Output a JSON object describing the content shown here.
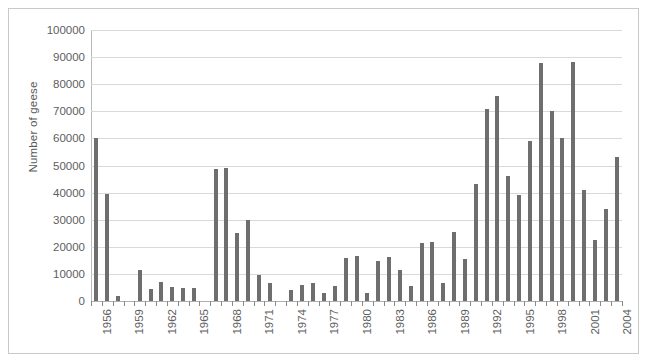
{
  "chart_data": {
    "type": "bar",
    "title": "",
    "xlabel": "",
    "ylabel": "Number of geese",
    "ylim": [
      0,
      100000
    ],
    "ytick_values": [
      0,
      10000,
      20000,
      30000,
      40000,
      50000,
      60000,
      70000,
      80000,
      90000,
      100000
    ],
    "ytick_labels": [
      "0",
      "10000",
      "20000",
      "30000",
      "40000",
      "50000",
      "60000",
      "70000",
      "80000",
      "90000",
      "100000"
    ],
    "grid": true,
    "legend": null,
    "bar_color": "#6e6e6e",
    "gridline_color": "#d9d9d9",
    "axis_color": "#b9b9b9",
    "label_color": "#5e5e5e",
    "xtick_labels": [
      "1956",
      "1959",
      "1962",
      "1965",
      "1968",
      "1971",
      "1974",
      "1977",
      "1980",
      "1983",
      "1986",
      "1989",
      "1992",
      "1995",
      "1998",
      "2001",
      "2004"
    ],
    "xtick_label_interval": 3,
    "categories": [
      "1956",
      "1957",
      "1958",
      "1959",
      "1960",
      "1961",
      "1962",
      "1963",
      "1964",
      "1965",
      "1966",
      "1967",
      "1968",
      "1969",
      "1970",
      "1971",
      "1972",
      "1973",
      "1974",
      "1975",
      "1976",
      "1977",
      "1978",
      "1979",
      "1980",
      "1981",
      "1982",
      "1983",
      "1984",
      "1985",
      "1986",
      "1987",
      "1988",
      "1989",
      "1990",
      "1991",
      "1992",
      "1993",
      "1994",
      "1995",
      "1996",
      "1997",
      "1998",
      "1999",
      "2000",
      "2001",
      "2002",
      "2003",
      "2004"
    ],
    "values": [
      60000,
      39500,
      2000,
      0,
      11300,
      4500,
      7000,
      5000,
      4800,
      4700,
      0,
      48800,
      49000,
      25200,
      30000,
      9500,
      6800,
      0,
      4000,
      5800,
      6500,
      2800,
      5600,
      16000,
      16600,
      3000,
      14600,
      16200,
      11600,
      5700,
      21300,
      21800,
      6500,
      25500,
      15600,
      43000,
      71000,
      75800,
      46300,
      39000,
      59000,
      88000,
      70000,
      60000,
      88200,
      40800,
      22500,
      34000,
      53000
    ]
  }
}
